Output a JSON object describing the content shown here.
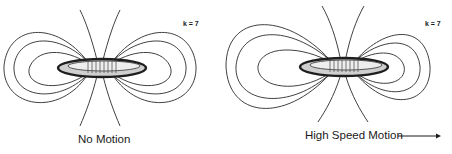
{
  "panels": [
    {
      "id": "no-motion",
      "caption": "No Motion",
      "k_label": "k = 7",
      "ring_center": [
        100,
        68
      ],
      "field_shape": "symmetric dipole"
    },
    {
      "id": "high-speed-motion",
      "caption": "High Speed Motion",
      "k_label": "k = 7",
      "ring_center": [
        343,
        67
      ],
      "field_shape": "asymmetric dipole, stretched trailing side",
      "direction_arrow": "right"
    }
  ],
  "colors": {
    "line": "#2a2a2a",
    "ring": "#1e1e1e",
    "background": "#ffffff"
  }
}
